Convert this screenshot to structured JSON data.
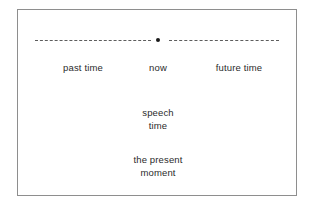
{
  "figure": {
    "type": "timeline-diagram",
    "background_color": "#ffffff",
    "frame_color": "#8e8e8e",
    "text_color": "#2b2b2b",
    "axis_color": "#5d5d5d",
    "dot_color": "#1a1a1a"
  },
  "timeline": {
    "past_segment_style": "dashed",
    "future_segment_style": "dashed",
    "origin_marker": "dot",
    "labels": {
      "past": "past time",
      "now": "now",
      "future": "future time"
    }
  },
  "annotations": {
    "speech": {
      "line1": "speech",
      "line2": "time"
    },
    "present": {
      "line1": "the present",
      "line2": "moment"
    }
  }
}
